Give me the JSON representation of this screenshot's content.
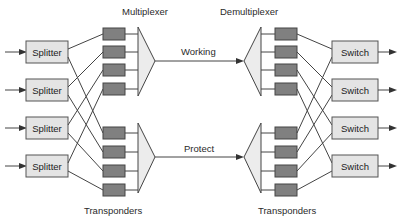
{
  "diagram": {
    "type": "optical 1+1 protection network (splitter / switch)",
    "labels": {
      "multiplexer": "Multiplexer",
      "demultiplexer": "Demultiplexer",
      "working": "Working",
      "protect": "Protect",
      "transponders_left": "Transponders",
      "transponders_right": "Transponders"
    },
    "splitters": [
      {
        "label": "Splitter"
      },
      {
        "label": "Splitter"
      },
      {
        "label": "Splitter"
      },
      {
        "label": "Splitter"
      }
    ],
    "switches": [
      {
        "label": "Switch"
      },
      {
        "label": "Switch"
      },
      {
        "label": "Switch"
      },
      {
        "label": "Switch"
      }
    ],
    "paths": [
      "Working",
      "Protect"
    ],
    "transponder_count_per_side": 8,
    "colors": {
      "box_fill": "#e4e4e4",
      "transponder_fill": "#808080",
      "mux_fill": "#ececec",
      "line": "#444444"
    }
  }
}
